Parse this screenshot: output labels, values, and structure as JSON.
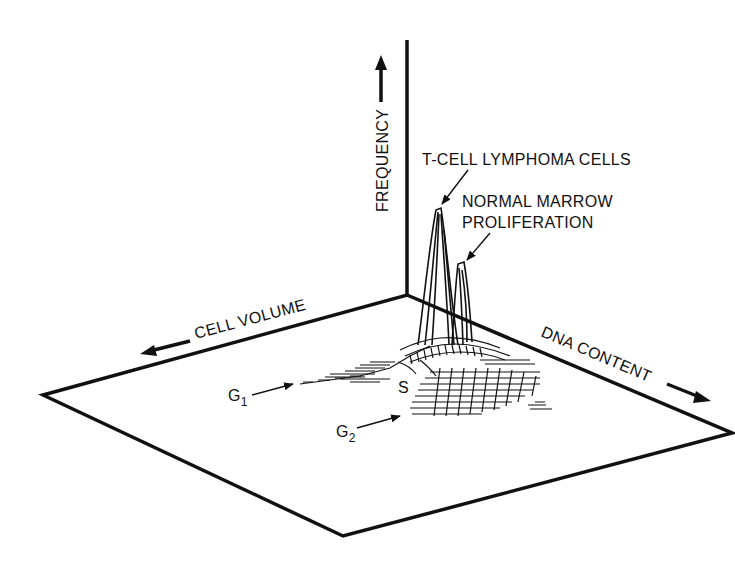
{
  "figure": {
    "type": "3d-histogram",
    "axes": {
      "frequency": "FREQUENCY",
      "cell_volume": "CELL VOLUME",
      "dna_content": "DNA CONTENT"
    },
    "annotations": {
      "peak1": "T-CELL LYMPHOMA CELLS",
      "peak2_line1": "NORMAL MARROW",
      "peak2_line2": "PROLIFERATION",
      "g1": "G",
      "g1_sub": "1",
      "g2": "G",
      "g2_sub": "2",
      "s": "S"
    },
    "colors": {
      "ink": "#111111",
      "background": "#ffffff"
    }
  }
}
